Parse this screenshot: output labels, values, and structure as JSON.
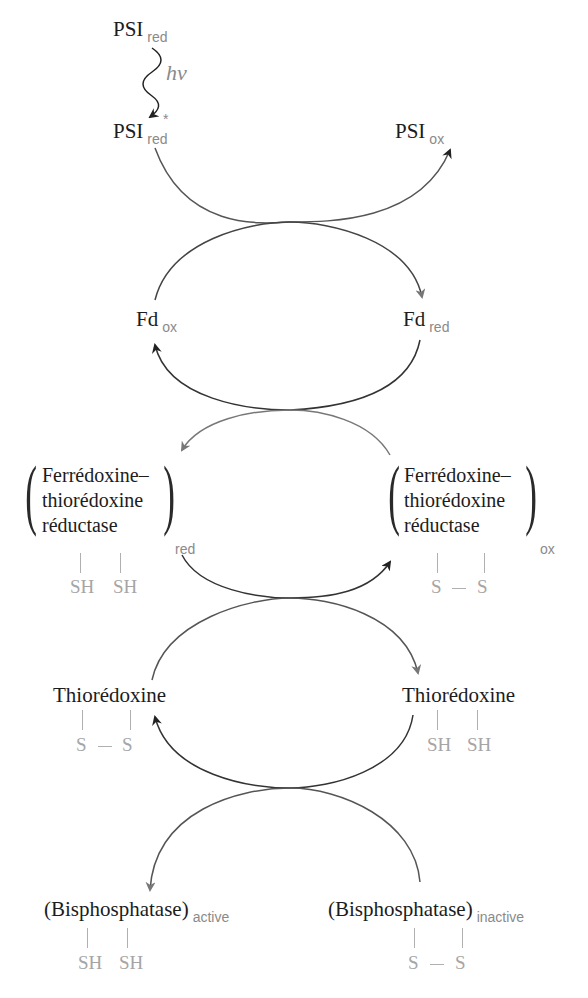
{
  "diagram": {
    "nodes": {
      "psi_red_top": {
        "main": "PSI",
        "sub": "red"
      },
      "light": {
        "label": "hν"
      },
      "psi_red_excited": {
        "main": "PSI",
        "sup": "*",
        "sub": "red"
      },
      "psi_ox": {
        "main": "PSI",
        "sub": "ox"
      },
      "fd_ox": {
        "main": "Fd",
        "sub": "ox"
      },
      "fd_red": {
        "main": "Fd",
        "sub": "red"
      },
      "ftr_red": {
        "lines": [
          "Ferrédoxine–",
          "thiorédoxine",
          "réductase"
        ],
        "sub": "red",
        "groups": [
          "SH",
          "SH"
        ]
      },
      "ftr_ox": {
        "lines": [
          "Ferrédoxine–",
          "thiorédoxine",
          "réductase"
        ],
        "sub": "ox",
        "groups": [
          "S",
          "S"
        ]
      },
      "trx_ox": {
        "main": "Thiorédoxine",
        "groups": [
          "S",
          "S"
        ]
      },
      "trx_red": {
        "main": "Thiorédoxine",
        "groups": [
          "SH",
          "SH"
        ]
      },
      "bpase_active": {
        "main": "(Bisphosphatase)",
        "sub": "active",
        "groups": [
          "SH",
          "SH"
        ]
      },
      "bpase_inactive": {
        "main": "(Bisphosphatase)",
        "sub": "inactive",
        "groups": [
          "S",
          "S"
        ]
      }
    },
    "colors": {
      "text": "#1c1c1c",
      "subscript": "#8a8a8a",
      "sulfur_groups": "#a5a5a5",
      "arrow_dark": "#222222",
      "arrow_gray": "#777777"
    }
  }
}
